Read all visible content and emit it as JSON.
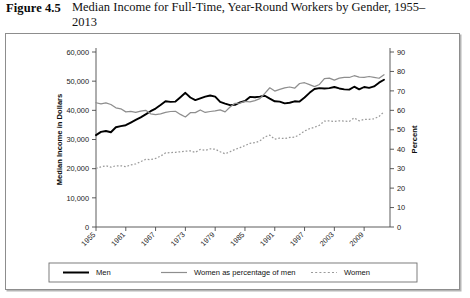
{
  "figure": {
    "label": "Figure 4.5",
    "title": "Median Income for Full-Time, Year-Round Workers by Gender, 1955–2013"
  },
  "axes": {
    "y_left_title": "Median Income in Dollars",
    "y_right_title": "Percent",
    "y_left_ticks": [
      "0",
      "10,000",
      "20,000",
      "30,000",
      "40,000",
      "50,000",
      "60,000"
    ],
    "y_right_ticks": [
      "0",
      "10",
      "20",
      "30",
      "40",
      "50",
      "60",
      "70",
      "80",
      "90"
    ],
    "x_ticks": [
      "1955",
      "1961",
      "1967",
      "1973",
      "1979",
      "1985",
      "1991",
      "1997",
      "2003",
      "2009"
    ]
  },
  "legend": {
    "items": [
      {
        "label": "Men",
        "style": "solid-thick-black",
        "color": "#000000"
      },
      {
        "label": "Women as percentage of men",
        "style": "solid-thin-gray",
        "color": "#8e8e8e"
      },
      {
        "label": "Women",
        "style": "dotted-gray",
        "color": "#9a9a9a"
      }
    ]
  },
  "chart_data": {
    "type": "line",
    "title": "Median Income for Full-Time, Year-Round Workers by Gender, 1955–2013",
    "xlabel": "",
    "ylabel": "Median Income in Dollars",
    "y2label": "Percent",
    "xlim": [
      1955,
      2013
    ],
    "ylim": [
      0,
      60000
    ],
    "y2lim": [
      0,
      90
    ],
    "grid": false,
    "legend_position": "bottom",
    "x": [
      1955,
      1956,
      1957,
      1958,
      1959,
      1960,
      1961,
      1962,
      1963,
      1964,
      1965,
      1966,
      1967,
      1968,
      1969,
      1970,
      1971,
      1972,
      1973,
      1974,
      1975,
      1976,
      1977,
      1978,
      1979,
      1980,
      1981,
      1982,
      1983,
      1984,
      1985,
      1986,
      1987,
      1988,
      1989,
      1990,
      1991,
      1992,
      1993,
      1994,
      1995,
      1996,
      1997,
      1998,
      1999,
      2000,
      2001,
      2002,
      2003,
      2004,
      2005,
      2006,
      2007,
      2008,
      2009,
      2010,
      2011,
      2012,
      2013
    ],
    "series": [
      {
        "name": "Men",
        "axis": "left",
        "style": "solid-thick-black",
        "color": "#000000",
        "values": [
          31500,
          32600,
          32900,
          32500,
          34200,
          34600,
          34900,
          35800,
          36700,
          37600,
          38600,
          39700,
          40600,
          41800,
          43100,
          42900,
          43000,
          44500,
          46000,
          44400,
          43500,
          44100,
          44700,
          45100,
          44700,
          42900,
          42300,
          41800,
          41900,
          42700,
          43200,
          44600,
          44500,
          44700,
          45000,
          44000,
          43100,
          43000,
          42400,
          42600,
          43100,
          43000,
          44400,
          46000,
          47300,
          47600,
          47500,
          47600,
          48000,
          47500,
          47200,
          47100,
          48100,
          47200,
          48000,
          47700,
          48200,
          49500,
          50500
        ]
      },
      {
        "name": "Women as percentage of men",
        "axis": "right",
        "style": "solid-thin-gray",
        "color": "#8e8e8e",
        "values": [
          63.9,
          63.3,
          63.8,
          63.0,
          61.3,
          60.8,
          59.2,
          59.5,
          58.9,
          59.6,
          60.0,
          58.2,
          57.8,
          58.2,
          58.9,
          59.4,
          59.5,
          57.9,
          56.6,
          58.8,
          58.8,
          60.2,
          58.9,
          59.4,
          59.7,
          60.2,
          59.2,
          61.7,
          63.6,
          63.7,
          64.6,
          64.3,
          65.0,
          66.0,
          68.7,
          71.6,
          69.9,
          70.8,
          71.5,
          72.0,
          71.4,
          73.8,
          74.2,
          73.2,
          72.2,
          73.3,
          76.3,
          76.6,
          75.5,
          76.6,
          77.0,
          76.9,
          77.8,
          77.1,
          77.0,
          77.4,
          77.0,
          76.5,
          78.3
        ]
      },
      {
        "name": "Women",
        "axis": "left",
        "style": "dotted-gray",
        "color": "#9a9a9a",
        "values": [
          20100,
          20600,
          21000,
          20500,
          21000,
          21000,
          20700,
          21300,
          21600,
          22400,
          23200,
          23100,
          23500,
          24300,
          25400,
          25500,
          25600,
          25800,
          26000,
          26100,
          25600,
          26600,
          26300,
          26800,
          26700,
          25800,
          25100,
          25800,
          26600,
          27200,
          27900,
          28700,
          28900,
          29500,
          30900,
          31500,
          30100,
          30500,
          30300,
          30700,
          30800,
          31700,
          32900,
          33700,
          34200,
          34900,
          36300,
          36400,
          36200,
          36400,
          36300,
          36200,
          37400,
          36400,
          36900,
          36900,
          37100,
          37900,
          39500
        ]
      }
    ]
  }
}
